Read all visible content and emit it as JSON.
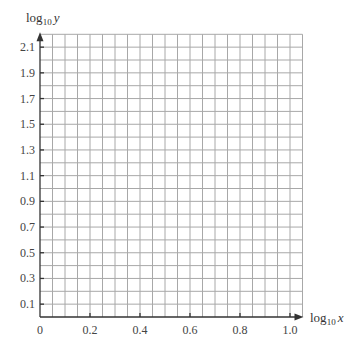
{
  "chart_data": {
    "type": "scatter",
    "title": "",
    "xlabel": "log10 x",
    "ylabel": "log10 y",
    "xlabel_parts": {
      "base": "log",
      "sub": "10",
      "var": "x"
    },
    "ylabel_parts": {
      "base": "log",
      "sub": "10",
      "var": "y"
    },
    "xlim": [
      0,
      1.05
    ],
    "ylim": [
      0,
      2.2
    ],
    "x_ticks": [
      0,
      0.2,
      0.4,
      0.6,
      0.8,
      1.0
    ],
    "x_tick_labels": [
      "0",
      "0.2",
      "0.4",
      "0.6",
      "0.8",
      "1.0"
    ],
    "y_ticks": [
      0.1,
      0.3,
      0.5,
      0.7,
      0.9,
      1.1,
      1.3,
      1.5,
      1.7,
      1.9,
      2.1
    ],
    "y_tick_labels": [
      "0.1",
      "0.3",
      "0.5",
      "0.7",
      "0.9",
      "1.1",
      "1.3",
      "1.5",
      "1.7",
      "1.9",
      "2.1"
    ],
    "grid": true,
    "grid_x_step": 0.05,
    "grid_y_step": 0.1,
    "series": [],
    "colors": {
      "grid": "#a8a8a8",
      "axis": "#333333",
      "text": "#444444"
    }
  }
}
